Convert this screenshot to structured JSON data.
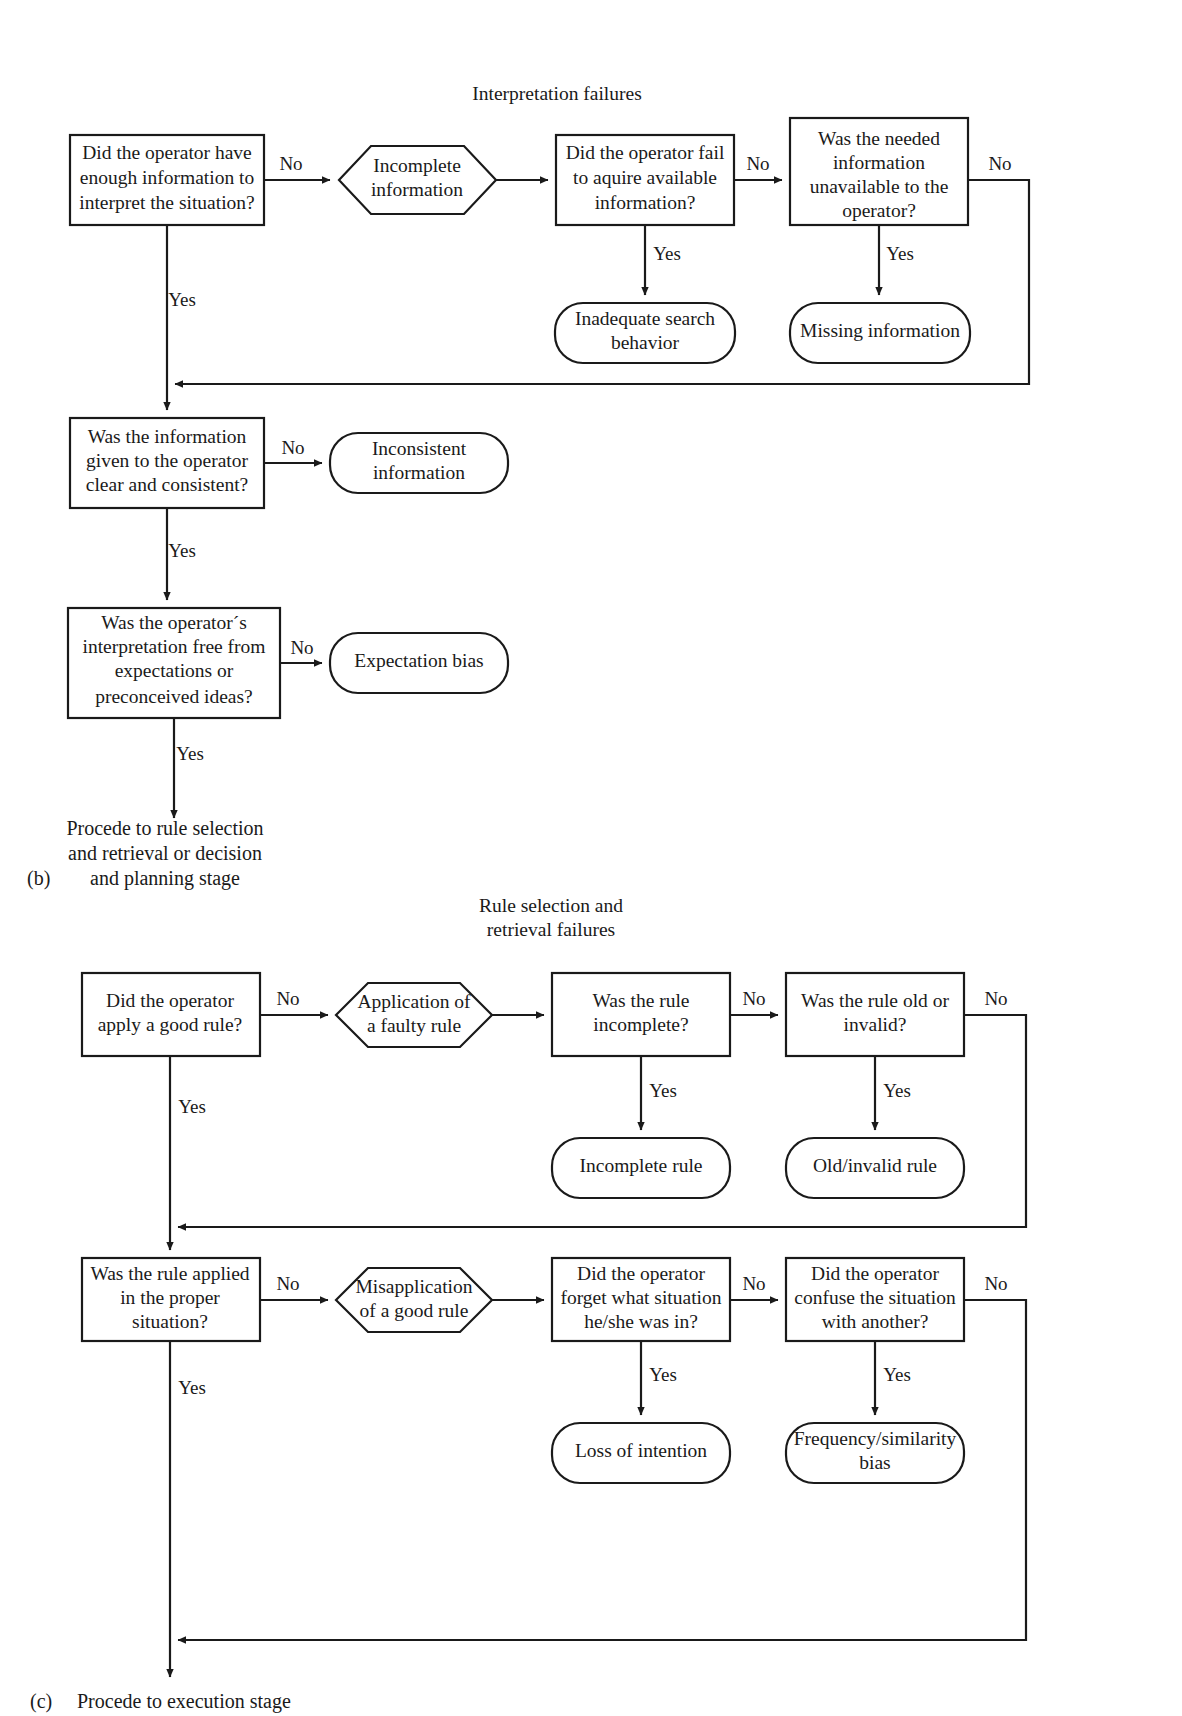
{
  "figure": {
    "panels": [
      {
        "letter": "(b)",
        "title": "Interpretation failures",
        "nodes": [
          {
            "id": "b-q1",
            "shape": "rect",
            "label": [
              "Did the operator have",
              "enough information to",
              "interpret the situation?"
            ]
          },
          {
            "id": "b-h1",
            "shape": "hexagon",
            "label": [
              "Incomplete",
              "information"
            ]
          },
          {
            "id": "b-q2",
            "shape": "rect",
            "label": [
              "Did the operator fail",
              "to aquire available",
              "information?"
            ]
          },
          {
            "id": "b-q3",
            "shape": "rect",
            "label": [
              "Was the needed",
              "information",
              "unavailable to the",
              "operator?"
            ]
          },
          {
            "id": "b-t1",
            "shape": "rounded",
            "label": [
              "Inadequate search",
              "behavior"
            ]
          },
          {
            "id": "b-t2",
            "shape": "rounded",
            "label": [
              "Missing information"
            ]
          },
          {
            "id": "b-q4",
            "shape": "rect",
            "label": [
              "Was the information",
              "given to the operator",
              "clear and consistent?"
            ]
          },
          {
            "id": "b-t3",
            "shape": "rounded",
            "label": [
              "Inconsistent",
              "information"
            ]
          },
          {
            "id": "b-q5",
            "shape": "rect",
            "label": [
              "Was the operator´s",
              "interpretation free from",
              "expectations or",
              "preconceived ideas?"
            ]
          },
          {
            "id": "b-t4",
            "shape": "rounded",
            "label": [
              "Expectation bias"
            ]
          }
        ],
        "edge_labels": [
          {
            "id": "b-l1",
            "text": "No"
          },
          {
            "id": "b-l2",
            "text": "No"
          },
          {
            "id": "b-l3",
            "text": "No"
          },
          {
            "id": "b-l4",
            "text": "Yes"
          },
          {
            "id": "b-l5",
            "text": "Yes"
          },
          {
            "id": "b-l6",
            "text": "Yes"
          },
          {
            "id": "b-l7",
            "text": "No"
          },
          {
            "id": "b-l8",
            "text": "Yes"
          },
          {
            "id": "b-l9",
            "text": "No"
          },
          {
            "id": "b-l10",
            "text": "Yes"
          }
        ],
        "exit_caption": [
          "Procede to rule selection",
          "and retrieval or decision",
          "and planning stage"
        ]
      },
      {
        "letter": "(c)",
        "title": [
          "Rule selection and",
          "retrieval failures"
        ],
        "nodes": [
          {
            "id": "c-q1",
            "shape": "rect",
            "label": [
              "Did the operator",
              "apply a good rule?"
            ]
          },
          {
            "id": "c-h1",
            "shape": "hexagon",
            "label": [
              "Application of",
              "a faulty rule"
            ]
          },
          {
            "id": "c-q2",
            "shape": "rect",
            "label": [
              "Was the rule",
              "incomplete?"
            ]
          },
          {
            "id": "c-q3",
            "shape": "rect",
            "label": [
              "Was the rule old or",
              "invalid?"
            ]
          },
          {
            "id": "c-t1",
            "shape": "rounded",
            "label": [
              "Incomplete rule"
            ]
          },
          {
            "id": "c-t2",
            "shape": "rounded",
            "label": [
              "Old/invalid rule"
            ]
          },
          {
            "id": "c-q4",
            "shape": "rect",
            "label": [
              "Was the rule applied",
              "in the proper",
              "situation?"
            ]
          },
          {
            "id": "c-h2",
            "shape": "hexagon",
            "label": [
              "Misapplication",
              "of a good rule"
            ]
          },
          {
            "id": "c-q5",
            "shape": "rect",
            "label": [
              "Did the operator",
              "forget what situation",
              "he/she was in?"
            ]
          },
          {
            "id": "c-q6",
            "shape": "rect",
            "label": [
              "Did the operator",
              "confuse the situation",
              "with another?"
            ]
          },
          {
            "id": "c-t3",
            "shape": "rounded",
            "label": [
              "Loss of intention"
            ]
          },
          {
            "id": "c-t4",
            "shape": "rounded",
            "label": [
              "Frequency/similarity",
              "bias"
            ]
          }
        ],
        "edge_labels": [
          {
            "id": "c-l1",
            "text": "No"
          },
          {
            "id": "c-l2",
            "text": "No"
          },
          {
            "id": "c-l3",
            "text": "No"
          },
          {
            "id": "c-l4",
            "text": "Yes"
          },
          {
            "id": "c-l5",
            "text": "Yes"
          },
          {
            "id": "c-l6",
            "text": "Yes"
          },
          {
            "id": "c-l7",
            "text": "No"
          },
          {
            "id": "c-l8",
            "text": "No"
          },
          {
            "id": "c-l9",
            "text": "No"
          },
          {
            "id": "c-l10",
            "text": "Yes"
          },
          {
            "id": "c-l11",
            "text": "Yes"
          },
          {
            "id": "c-l12",
            "text": "Yes"
          }
        ],
        "exit_caption": [
          "Procede to execution stage"
        ]
      }
    ],
    "colors": {
      "stroke": "#1a1a1a",
      "fill": "#ffffff",
      "background": "#ffffff"
    }
  }
}
